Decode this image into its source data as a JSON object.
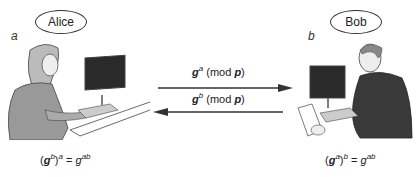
{
  "alice": {
    "name": "Alice",
    "label": "a",
    "formula": {
      "base": "g",
      "inner_exp": "b",
      "outer_exp": "a",
      "result_base": "g",
      "result_exp": "ab"
    }
  },
  "bob": {
    "name": "Bob",
    "label": "b",
    "formula": {
      "base": "g",
      "inner_exp": "a",
      "outer_exp": "b",
      "result_base": "g",
      "result_exp": "ab"
    }
  },
  "messages": [
    {
      "direction": "alice-to-bob",
      "base": "g",
      "exp": "a",
      "mod_open": " (mod ",
      "mod_var": "p",
      "mod_close": ")"
    },
    {
      "direction": "bob-to-alice",
      "base": "g",
      "exp": "b",
      "mod_open": " (mod ",
      "mod_var": "p",
      "mod_close": ")"
    }
  ],
  "colors": {
    "line": "#333333",
    "figure_fill": "#8a8a8a",
    "screen": "#2a2a2a"
  }
}
